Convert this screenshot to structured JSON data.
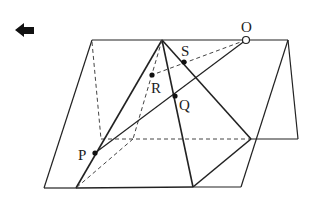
{
  "nav": {
    "back_icon": "left-arrow-icon"
  },
  "diagram": {
    "colors": {
      "line": "#222222",
      "dashed": "#444444",
      "background": "#ffffff"
    },
    "labels": {
      "O": "O",
      "S": "S",
      "R": "R",
      "Q": "Q",
      "P": "P"
    },
    "points": {
      "apex": [
        162,
        40
      ],
      "O": [
        246,
        40
      ],
      "S": [
        184,
        62
      ],
      "R": [
        152,
        75
      ],
      "Q": [
        175,
        96
      ],
      "P": [
        95,
        153
      ],
      "base_front_left": [
        76,
        188
      ],
      "base_front_right": [
        193,
        187
      ],
      "base_right": [
        251,
        139
      ],
      "base_back": [
        133,
        139
      ]
    }
  }
}
